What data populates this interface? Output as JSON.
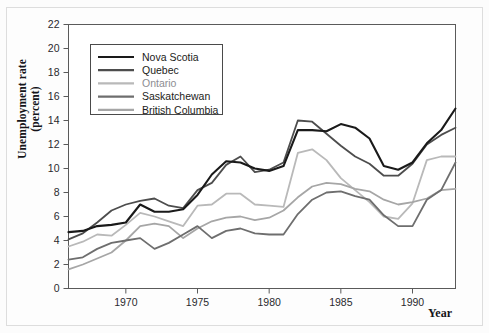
{
  "figure": {
    "ylabel_line1": "Unemployment rate",
    "ylabel_line2": "(percent)",
    "xlabel": "Year"
  },
  "chart_data": {
    "type": "line",
    "title": "",
    "xlabel": "Year",
    "ylabel": "Unemployment rate (percent)",
    "xlim": [
      1966,
      1993
    ],
    "ylim": [
      0,
      22
    ],
    "ytick_step": 2,
    "yticks": [
      0,
      2,
      4,
      6,
      8,
      10,
      12,
      14,
      16,
      18,
      20,
      22
    ],
    "xticks": [
      1970,
      1975,
      1980,
      1985,
      1990
    ],
    "grid": false,
    "legend_position": "upper-left",
    "x": [
      1966,
      1967,
      1968,
      1969,
      1970,
      1971,
      1972,
      1973,
      1974,
      1975,
      1976,
      1977,
      1978,
      1979,
      1980,
      1981,
      1982,
      1983,
      1984,
      1985,
      1986,
      1987,
      1988,
      1989,
      1990,
      1991,
      1992
    ],
    "series": [
      {
        "name": "Nova Scotia",
        "color": "#1a1a1a",
        "values": [
          4.7,
          4.8,
          5.2,
          5.3,
          5.5,
          7.0,
          6.4,
          6.4,
          6.6,
          7.8,
          9.5,
          10.6,
          10.5,
          10.0,
          9.8,
          10.2,
          13.2,
          13.2,
          13.1,
          13.7,
          13.4,
          12.5,
          10.2,
          9.9,
          10.5,
          12.1,
          13.2
        ],
        "endpoint_high": 15.0
      },
      {
        "name": "Quebec",
        "color": "#4d4d4d",
        "values": [
          4.1,
          4.6,
          5.5,
          6.5,
          7.0,
          7.3,
          7.5,
          6.9,
          6.7,
          8.2,
          8.8,
          10.3,
          11.0,
          9.7,
          9.9,
          10.5,
          14.0,
          13.9,
          12.9,
          11.9,
          11.0,
          10.4,
          9.4,
          9.4,
          10.4,
          12.0,
          12.8
        ],
        "endpoint_high": 13.4
      },
      {
        "name": "Ontario",
        "color": "#b9b9b9",
        "values": [
          3.5,
          3.9,
          4.5,
          4.4,
          5.3,
          6.3,
          6.0,
          5.6,
          5.2,
          6.9,
          7.0,
          7.9,
          7.9,
          7.0,
          6.9,
          6.8,
          11.3,
          11.6,
          10.7,
          9.2,
          8.2,
          7.2,
          6.0,
          5.8,
          7.1,
          10.7,
          11.0
        ],
        "endpoint_high": 11.0
      },
      {
        "name": "Saskatchewan",
        "color": "#6e6e6e",
        "values": [
          2.4,
          2.6,
          3.3,
          3.8,
          4.0,
          4.2,
          3.3,
          3.8,
          4.5,
          5.2,
          4.2,
          4.8,
          5.0,
          4.6,
          4.5,
          4.5,
          6.2,
          7.4,
          8.0,
          8.1,
          7.7,
          7.4,
          6.1,
          5.2,
          5.2,
          7.4,
          8.2
        ],
        "endpoint_high": 10.5
      },
      {
        "name": "British Columbia",
        "color": "#a6a6a6",
        "values": [
          1.6,
          2.0,
          2.5,
          3.0,
          4.0,
          5.2,
          5.4,
          5.2,
          4.2,
          5.0,
          5.6,
          5.9,
          6.0,
          5.7,
          5.9,
          6.5,
          7.6,
          8.5,
          8.8,
          8.7,
          8.3,
          8.1,
          7.4,
          7.0,
          7.2,
          7.5,
          8.2
        ],
        "endpoint_high": 8.3
      }
    ],
    "legend": [
      {
        "label": "Nova Scotia",
        "color": "#1a1a1a"
      },
      {
        "label": "Quebec",
        "color": "#4d4d4d"
      },
      {
        "label": "Ontario",
        "color": "#b9b9b9"
      },
      {
        "label": "Saskatchewan",
        "color": "#6e6e6e"
      },
      {
        "label": "British Columbia",
        "color": "#a6a6a6"
      }
    ]
  }
}
